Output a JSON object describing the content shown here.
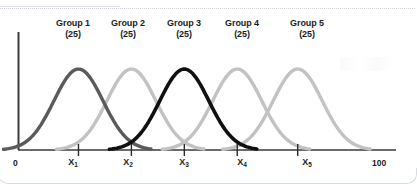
{
  "figure": {
    "title": "",
    "axis_start_label": "0",
    "axis_end_label": "100",
    "groups": [
      {
        "name": "Group 1",
        "n_label": "(25)",
        "tick_label": "X",
        "tick_sub": "1",
        "mean": 16,
        "color": "#5a5a5a"
      },
      {
        "name": "Group 2",
        "n_label": "(25)",
        "tick_label": "X",
        "tick_sub": "2",
        "mean": 30,
        "color": "#c2c2c2"
      },
      {
        "name": "Group 3",
        "n_label": "(25)",
        "tick_label": "X",
        "tick_sub": "3",
        "mean": 44,
        "color": "#101010"
      },
      {
        "name": "Group 4",
        "n_label": "(25)",
        "tick_label": "X",
        "tick_sub": "4",
        "mean": 58,
        "color": "#c2c2c2"
      },
      {
        "name": "Group 5",
        "n_label": "(25)",
        "tick_label": "X",
        "tick_sub": "5",
        "mean": 74,
        "color": "#c2c2c2"
      }
    ]
  },
  "chart_data": {
    "type": "line",
    "title": "",
    "subtitle": "",
    "xlabel": "",
    "ylabel": "",
    "xlim": [
      0,
      100
    ],
    "ylim": [
      0,
      1
    ],
    "grid": false,
    "legend": "none",
    "legend_position": "above-curves-inline",
    "axis_tick_labels": [
      "0",
      "X1",
      "X2",
      "X3",
      "X4",
      "X5",
      "100"
    ],
    "axis_tick_values": [
      0,
      16,
      30,
      44,
      58,
      74,
      100
    ],
    "annotations": [
      "Group 1 (25)",
      "Group 2 (25)",
      "Group 3 (25)",
      "Group 4 (25)",
      "Group 5 (25)"
    ],
    "series": [
      {
        "name": "Group 1",
        "sample_size": 25,
        "mean": 16,
        "sd": 6.5,
        "peak_height": 1.0,
        "color": "#5a5a5a"
      },
      {
        "name": "Group 2",
        "sample_size": 25,
        "mean": 30,
        "sd": 6.5,
        "peak_height": 1.0,
        "color": "#c2c2c2"
      },
      {
        "name": "Group 3",
        "sample_size": 25,
        "mean": 44,
        "sd": 6.5,
        "peak_height": 1.0,
        "color": "#101010"
      },
      {
        "name": "Group 4",
        "sample_size": 25,
        "mean": 58,
        "sd": 6.5,
        "peak_height": 1.0,
        "color": "#c2c2c2"
      },
      {
        "name": "Group 5",
        "sample_size": 25,
        "mean": 74,
        "sd": 6.5,
        "peak_height": 1.0,
        "color": "#c2c2c2"
      }
    ]
  },
  "colors": {
    "dark_gray": "#5a5a5a",
    "light_gray": "#c2c2c2",
    "black": "#101010",
    "axis": "#3a3a3a",
    "text": "#1b1b1b",
    "background": "#ffffff"
  }
}
